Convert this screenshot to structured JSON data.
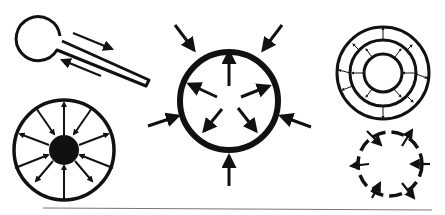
{
  "diagram": {
    "background": "#ffffff",
    "ink": "#111111",
    "rule_color": "#777777",
    "figures": [
      {
        "id": "keyhole-tube",
        "description": "circle with attached tube, arrows along tube in opposite directions"
      },
      {
        "id": "radial-outward-circle",
        "description": "circle with solid core and 12 radial arrows alternating in/out"
      },
      {
        "id": "thick-ring-inward-outward",
        "description": "thick circle with 5 inner outward arrows and 5 outer inward arrows"
      },
      {
        "id": "concentric-rings",
        "description": "three concentric rings with small radial arrows between rings"
      },
      {
        "id": "dashed-ring",
        "description": "dashed ring with 6 arrows crossing in alternating directions"
      }
    ]
  }
}
